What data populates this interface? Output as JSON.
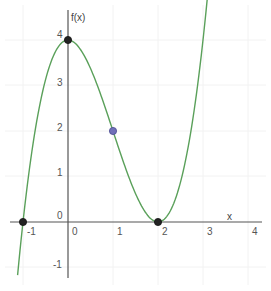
{
  "chart_data": {
    "type": "line",
    "title": "",
    "xlabel": "x",
    "ylabel": "f(x)",
    "function": "f(x) = x^3 - 3x^2 + 4",
    "xlim": [
      -1.5,
      4.5
    ],
    "ylim": [
      -1.5,
      4.9
    ],
    "grid": true,
    "x_ticks": [
      "-1",
      "0",
      "1",
      "2",
      "3",
      "4"
    ],
    "y_ticks": [
      "-1",
      "0",
      "1",
      "2",
      "3",
      "4"
    ],
    "series": [
      {
        "name": "f(x)",
        "color": "#5aa05a",
        "x": [
          -1.12,
          -1,
          -0.5,
          0,
          0.5,
          1,
          1.5,
          2,
          2.5,
          3,
          3.12
        ],
        "y": [
          -1.17,
          0,
          3.125,
          4,
          3.375,
          2,
          0.625,
          0,
          0.875,
          4,
          4.66
        ]
      }
    ],
    "points": [
      {
        "label": "local maximum",
        "x": 0,
        "y": 4,
        "color": "#222222"
      },
      {
        "label": "root",
        "x": -1,
        "y": 0,
        "color": "#222222"
      },
      {
        "label": "double root / local minimum",
        "x": 2,
        "y": 0,
        "color": "#222222"
      },
      {
        "label": "inflection point",
        "x": 1,
        "y": 2,
        "color": "#7070b8"
      }
    ]
  },
  "labels": {
    "x_axis": "x",
    "y_axis": "f(x)",
    "x_ticks": [
      {
        "text": "-1",
        "x": -1
      },
      {
        "text": "0",
        "x": 0
      },
      {
        "text": "1",
        "x": 1
      },
      {
        "text": "2",
        "x": 2
      },
      {
        "text": "3",
        "x": 3
      },
      {
        "text": "4",
        "x": 4
      }
    ],
    "y_ticks": [
      {
        "text": "4",
        "y": 4
      },
      {
        "text": "3",
        "y": 3
      },
      {
        "text": "2",
        "y": 2
      },
      {
        "text": "1",
        "y": 1
      },
      {
        "text": "0",
        "y": 0
      },
      {
        "text": "-1",
        "y": -1
      }
    ]
  }
}
